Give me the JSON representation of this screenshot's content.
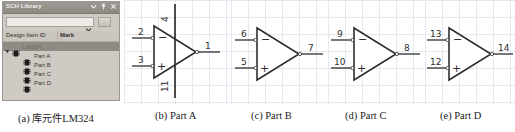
{
  "figure": {
    "captions": [
      {
        "id": "a",
        "prefix": "(a)",
        "cn": "库元件",
        "text": "LM324",
        "full": "(a) 库元件LM324"
      },
      {
        "id": "b",
        "prefix": "(b)",
        "text": "Part A",
        "full": "(b) Part A"
      },
      {
        "id": "c",
        "prefix": "(c)",
        "text": "Part B",
        "full": "(c) Part B"
      },
      {
        "id": "d",
        "prefix": "(d)",
        "text": "Part C",
        "full": "(d) Part C"
      },
      {
        "id": "e",
        "prefix": "(e)",
        "text": "Part D",
        "full": "(e) Part D"
      }
    ]
  },
  "panel": {
    "title": "SCH Library",
    "title_icons": [
      {
        "name": "chevron-down-icon",
        "glyph": "▾"
      },
      {
        "name": "pin-icon",
        "glyph": "⚲"
      },
      {
        "name": "close-icon",
        "glyph": "✕"
      }
    ],
    "search": {
      "value": "",
      "placeholder": "",
      "dropdown_icon": "chevron-down-icon",
      "button_label": ""
    },
    "columns": [
      {
        "label": "Design Item ID",
        "sort_indicator": "sort-ascending-icon"
      },
      {
        "label": "Mark"
      }
    ],
    "tree": [
      {
        "label": "LM324",
        "level": 0,
        "selected": true,
        "expanded": true,
        "icon": "component-icon"
      },
      {
        "label": "Part A",
        "level": 1,
        "selected": false,
        "icon": "component-icon"
      },
      {
        "label": "Part B",
        "level": 1,
        "selected": false,
        "icon": "component-icon"
      },
      {
        "label": "Part C",
        "level": 1,
        "selected": false,
        "icon": "component-icon"
      },
      {
        "label": "Part D",
        "level": 1,
        "selected": false,
        "icon": "component-icon"
      }
    ]
  },
  "schematics": {
    "part_a": {
      "name": "Part A",
      "inverting_pin": "2",
      "noninverting_pin": "3",
      "output_pin": "1",
      "power_pos_pin": "4",
      "power_neg_pin": "11",
      "inverting_symbol": "−",
      "noninverting_symbol": "+",
      "has_power_pins": true
    },
    "part_b": {
      "name": "Part B",
      "inverting_pin": "6",
      "noninverting_pin": "5",
      "output_pin": "7",
      "inverting_symbol": "−",
      "noninverting_symbol": "+",
      "has_power_pins": false
    },
    "part_c": {
      "name": "Part C",
      "inverting_pin": "9",
      "noninverting_pin": "10",
      "output_pin": "8",
      "inverting_symbol": "−",
      "noninverting_symbol": "+",
      "has_power_pins": false
    },
    "part_d": {
      "name": "Part D",
      "inverting_pin": "13",
      "noninverting_pin": "12",
      "output_pin": "14",
      "inverting_symbol": "−",
      "noninverting_symbol": "+",
      "has_power_pins": false
    }
  },
  "colors": {
    "panel_bg": "#cfcbc4",
    "titlebar": "#8d8a83",
    "selection": "#8f8b84",
    "grid_line": "#c9cfe0",
    "wire": "#3a3a3a",
    "page_bg": "#ffffff"
  }
}
